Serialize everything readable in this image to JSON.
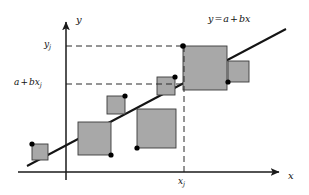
{
  "figure": {
    "background_color": "#ffffff",
    "axes": {
      "x_axis_label": "x",
      "y_axis_label": "y",
      "axis_color": "#1a1a1a",
      "origin_px": [
        66,
        172
      ],
      "x_axis_end_px": [
        283,
        172
      ],
      "y_axis_top_px": [
        66,
        18
      ]
    },
    "line": {
      "equation_label": "y = a + bx",
      "equation_parts": {
        "lhs": "y",
        "eq": "=",
        "intercept": "a",
        "plus": "+",
        "slope": "b",
        "variable": "x"
      },
      "color": "#141414",
      "start_px": [
        27,
        166
      ],
      "end_px": [
        286,
        29
      ]
    },
    "guides": {
      "color": "#2b2b2b",
      "style": "dashed",
      "y_j": {
        "label_main": "y",
        "label_sub": "j",
        "y_px": 46,
        "from_x_px": 66,
        "to_x_px": 184
      },
      "fitted": {
        "label_a": "a",
        "label_plus": "+",
        "label_b": "b",
        "label_x": "x",
        "label_sub": "j",
        "y_px": 84,
        "from_x_px": 66,
        "to_x_px": 184
      },
      "x_j": {
        "label_main": "x",
        "label_sub": "j",
        "x_px": 184,
        "from_y_px": 46,
        "to_y_px": 172
      }
    },
    "squares": {
      "fill_color": "#a8a8a8",
      "stroke_color": "#3a3a3a",
      "items": [
        {
          "name": "residual-square-1",
          "x": 32,
          "y": 144,
          "size": 16,
          "dot_corner": "top-left"
        },
        {
          "name": "residual-square-2",
          "x": 78,
          "y": 122,
          "size": 33,
          "dot_corner": "bottom-right"
        },
        {
          "name": "residual-square-3",
          "x": 107,
          "y": 96,
          "size": 18,
          "dot_corner": "top-right"
        },
        {
          "name": "residual-square-4",
          "x": 137,
          "y": 109,
          "size": 39,
          "dot_corner": "bottom-left"
        },
        {
          "name": "residual-square-5",
          "x": 157,
          "y": 77,
          "size": 18,
          "dot_corner": "top-right"
        },
        {
          "name": "residual-square-6-highlighted",
          "x": 183,
          "y": 46,
          "size": 44,
          "dot_corner": "top-left"
        },
        {
          "name": "residual-square-7",
          "x": 228,
          "y": 61,
          "size": 21,
          "dot_corner": "bottom-left"
        }
      ]
    },
    "data_points": {
      "color": "#000000",
      "radius_px": 2.6,
      "points": [
        {
          "name": "data-point-1",
          "x": 32,
          "y": 144
        },
        {
          "name": "data-point-2",
          "x": 111,
          "y": 155
        },
        {
          "name": "data-point-3",
          "x": 125,
          "y": 96
        },
        {
          "name": "data-point-4",
          "x": 137,
          "y": 148
        },
        {
          "name": "data-point-5",
          "x": 175,
          "y": 77
        },
        {
          "name": "data-point-6-xj-yj",
          "x": 183,
          "y": 46
        },
        {
          "name": "data-point-7",
          "x": 228,
          "y": 82
        }
      ]
    }
  }
}
